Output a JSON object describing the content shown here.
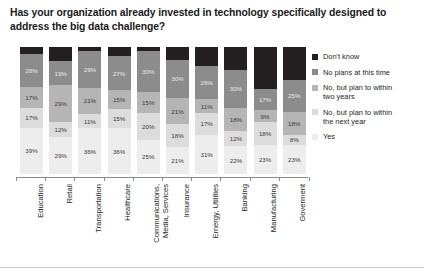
{
  "chart_data": {
    "type": "bar",
    "subtype": "stacked-bar-100",
    "title": "Has your organization already invested in technology specifically designed to address the big data challenge?",
    "xlabel": "",
    "ylabel": "",
    "ylim": [
      0,
      100
    ],
    "grid": false,
    "legend_position": "right",
    "orientation": "vertical",
    "categories": [
      "Education",
      "Retail",
      "Transportation",
      "Healthcare",
      "Communications,\nMedia, Services",
      "Insurance",
      "Emergy, Utilities",
      "Banking",
      "Manufacturing",
      "Goverment"
    ],
    "series": [
      {
        "name": "Don't know",
        "color": "#231f20",
        "values": [
          6,
          11,
          3,
          7,
          3,
          10,
          15,
          18,
          33,
          26
        ],
        "labels": [
          "",
          "",
          "",
          "",
          "",
          "",
          "",
          "",
          "",
          ""
        ]
      },
      {
        "name": "No plans at this time",
        "color": "#8c8c8c",
        "values": [
          28,
          19,
          29,
          27,
          30,
          30,
          26,
          30,
          17,
          25
        ],
        "labels": [
          "28%",
          "19%",
          "29%",
          "27%",
          "30%",
          "30%",
          "26%",
          "30%",
          "17%",
          "25%"
        ]
      },
      {
        "name": "No, but plan to within\ntwo years",
        "color": "#b5b5b5",
        "values": [
          17,
          29,
          21,
          15,
          15,
          21,
          11,
          18,
          9,
          18
        ],
        "labels": [
          "17%",
          "29%",
          "21%",
          "15%",
          "15%",
          "21%",
          "11%",
          "18%",
          "9%",
          "18%"
        ]
      },
      {
        "name": "No, but plan to within\nthe next year",
        "color": "#dcdcdc",
        "values": [
          17,
          12,
          11,
          15,
          20,
          18,
          17,
          12,
          18,
          8
        ],
        "labels": [
          "17%",
          "12%",
          "11%",
          "15%",
          "20%",
          "18%",
          "17%",
          "12%",
          "18%",
          "8%"
        ]
      },
      {
        "name": "Yes",
        "color": "#ededed",
        "values": [
          39,
          29,
          36,
          36,
          25,
          21,
          31,
          22,
          23,
          23
        ],
        "labels": [
          "39%",
          "29%",
          "36%",
          "36%",
          "25%",
          "21%",
          "31%",
          "22%",
          "23%",
          "23%"
        ]
      }
    ]
  },
  "legend": {
    "items": [
      {
        "label": "Don't know",
        "color": "#231f20"
      },
      {
        "label": "No plans at this time",
        "color": "#8c8c8c"
      },
      {
        "label": "No, but plan to within\ntwo years",
        "color": "#b5b5b5"
      },
      {
        "label": "No, but plan to within\nthe next year",
        "color": "#dcdcdc"
      },
      {
        "label": "Yes",
        "color": "#ededed"
      }
    ]
  }
}
